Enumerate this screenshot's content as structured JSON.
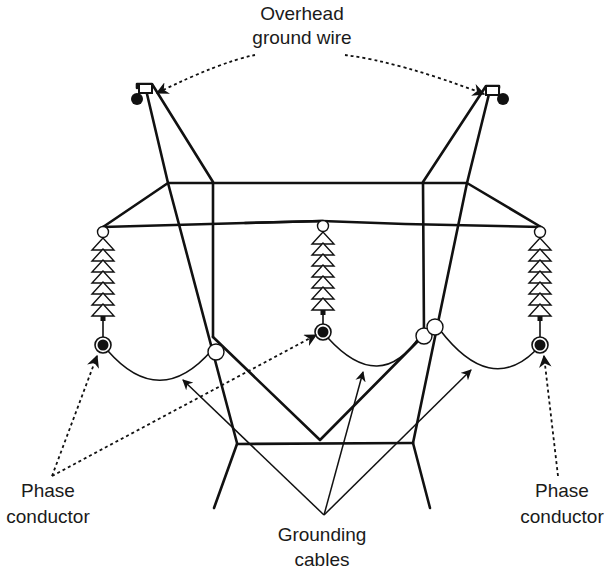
{
  "diagram": {
    "labels": {
      "overhead_ground_wire": [
        "Overhead",
        "ground wire"
      ],
      "phase_conductor_left": [
        "Phase",
        "conductor"
      ],
      "phase_conductor_right": [
        "Phase",
        "conductor"
      ],
      "grounding_cables": [
        "Grounding",
        "cables"
      ]
    },
    "components": {
      "insulator_strings": 3,
      "insulator_discs_per_string": 7,
      "phase_conductors": 3,
      "overhead_ground_wires": 2,
      "grounding_cable_clamps": 3
    },
    "colors": {
      "line": "#111111",
      "background": "#ffffff",
      "text": "#1a1a1a"
    }
  }
}
